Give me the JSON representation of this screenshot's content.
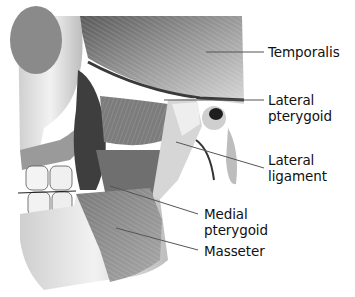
{
  "figure": {
    "colors": {
      "background": "#ffffff",
      "label_text": "#111111",
      "leader_line": "#555555"
    },
    "labels": [
      {
        "id": "temporalis",
        "lines": [
          "Temporalis"
        ]
      },
      {
        "id": "lateral-pterygoid",
        "lines": [
          "Lateral",
          "pterygoid"
        ]
      },
      {
        "id": "lateral-ligament",
        "lines": [
          "Lateral",
          "ligament"
        ]
      },
      {
        "id": "medial-pterygoid",
        "lines": [
          "Medial",
          "pterygoid"
        ]
      },
      {
        "id": "masseter",
        "lines": [
          "Masseter"
        ]
      }
    ]
  }
}
